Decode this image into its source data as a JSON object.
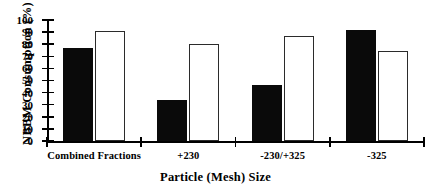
{
  "chart_data": {
    "type": "bar",
    "title": "",
    "xlabel": "Particle (Mesh) Size",
    "ylabel": "NBBM  Consumption  (%)",
    "categories": [
      "Combined Fractions",
      "+230",
      "-230/+325",
      "-325"
    ],
    "ylim": [
      0,
      100
    ],
    "yticks": [
      0,
      10,
      20,
      30,
      40,
      50,
      60,
      70,
      80,
      90,
      100
    ],
    "grid": false,
    "legend": "none",
    "series": [
      {
        "name": "solid",
        "values": [
          77,
          34,
          46,
          92
        ],
        "color": "#0a0a0a",
        "fill": "solid"
      },
      {
        "name": "hollow",
        "values": [
          91,
          80,
          87,
          74
        ],
        "color": "#ffffff",
        "fill": "hollow"
      }
    ]
  },
  "axis": {
    "tick_labels": [
      "0",
      "10",
      "20",
      "30",
      "40",
      "50",
      "60",
      "70",
      "80",
      "90",
      "100"
    ]
  }
}
